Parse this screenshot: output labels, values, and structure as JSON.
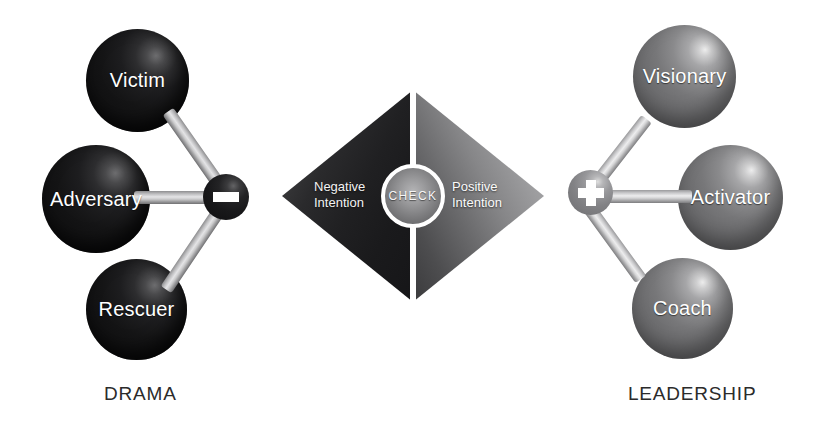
{
  "diagram": {
    "title_left": "DRAMA",
    "title_right": "LEADERSHIP",
    "center": {
      "check_label": "CHECK",
      "negative_line1": "Negative",
      "negative_line2": "Intention",
      "positive_line1": "Positive",
      "positive_line2": "Intention",
      "minus_sign": "minus-sign",
      "plus_sign": "plus-sign"
    },
    "drama_nodes": [
      {
        "label": "Victim",
        "icon": "sphere-icon"
      },
      {
        "label": "Adversary",
        "icon": "sphere-icon"
      },
      {
        "label": "Rescuer",
        "icon": "sphere-icon"
      }
    ],
    "leadership_nodes": [
      {
        "label": "Visionary",
        "icon": "sphere-icon"
      },
      {
        "label": "Activator",
        "icon": "sphere-icon"
      },
      {
        "label": "Coach",
        "icon": "sphere-icon"
      }
    ],
    "colors": {
      "background": "#ffffff",
      "drama_sphere": "#141416",
      "leadership_sphere": "#75757a",
      "diamond_left": "#202022",
      "diamond_right": "#8a8a8c",
      "rod": "#e4e4e6",
      "caption_text": "#2b2b2b",
      "node_text": "#ffffff"
    }
  }
}
